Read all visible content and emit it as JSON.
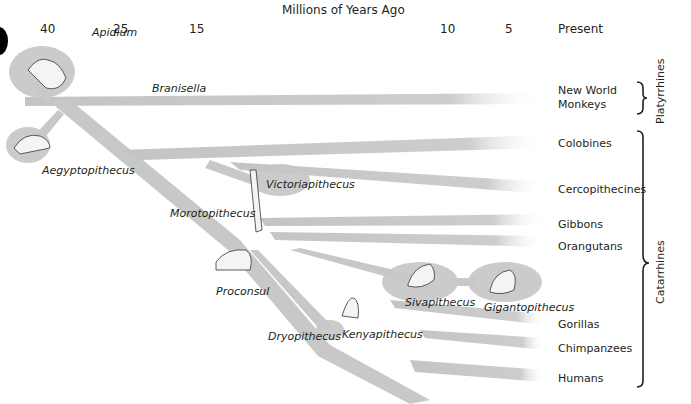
{
  "axis": {
    "title": "Millions of Years Ago",
    "ticks": [
      {
        "label": "40",
        "x": 40
      },
      {
        "label": "25",
        "x": 113
      },
      {
        "label": "15",
        "x": 189
      },
      {
        "label": "10",
        "x": 440
      },
      {
        "label": "5",
        "x": 505
      },
      {
        "label": "Present",
        "x": 558
      }
    ]
  },
  "fossil_taxa": [
    {
      "name": "Apidium",
      "x": 118,
      "y": 26
    },
    {
      "name": "Branisella",
      "x": 152,
      "y": 83
    },
    {
      "name": "Aegyptopithecus",
      "x": 42,
      "y": 165
    },
    {
      "name": "Victoriapithecus",
      "x": 266,
      "y": 180
    },
    {
      "name": "Morotopithecus",
      "x": 172,
      "y": 208
    },
    {
      "name": "Proconsul",
      "x": 216,
      "y": 286
    },
    {
      "name": "Dryopithecus",
      "x": 268,
      "y": 331
    },
    {
      "name": "Kenyapithecus",
      "x": 342,
      "y": 329
    },
    {
      "name": "Sivapithecus",
      "x": 405,
      "y": 297
    },
    {
      "name": "Gigantopithecus",
      "x": 484,
      "y": 302
    }
  ],
  "living_groups": [
    {
      "name": "New World",
      "name2": "Monkeys",
      "x": 558,
      "y": 85
    },
    {
      "name": "Colobines",
      "x": 558,
      "y": 137
    },
    {
      "name": "Cercopithecines",
      "x": 558,
      "y": 183
    },
    {
      "name": "Gibbons",
      "x": 558,
      "y": 218
    },
    {
      "name": "Orangutans",
      "x": 558,
      "y": 240
    },
    {
      "name": "Gorillas",
      "x": 558,
      "y": 318
    },
    {
      "name": "Chimpanzees",
      "x": 558,
      "y": 342
    },
    {
      "name": "Humans",
      "x": 558,
      "y": 372
    }
  ],
  "clades": [
    {
      "name": "Platyrrhines"
    },
    {
      "name": "Catarrhines"
    }
  ],
  "colors": {
    "branch": "#c8c8c8",
    "blob": "#cfcfcf",
    "text": "#231f20"
  }
}
